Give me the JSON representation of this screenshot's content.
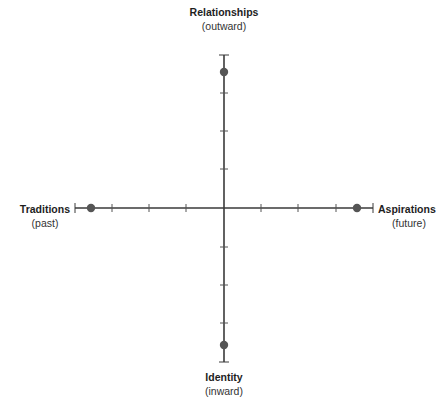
{
  "diagram": {
    "type": "crossed-axes",
    "colors": {
      "axis": "#3a3a3a",
      "tick": "#555555",
      "dot": "#555555",
      "background": "#ffffff"
    },
    "poles": {
      "top": {
        "name": "Relationships",
        "sub": "(outward)"
      },
      "bottom": {
        "name": "Identity",
        "sub": "(inward)"
      },
      "left": {
        "name": "Traditions",
        "sub": "(past)"
      },
      "right": {
        "name": "Aspirations",
        "sub": "(future)"
      }
    },
    "axes": {
      "horizontal": {
        "from": "Traditions",
        "to": "Aspirations",
        "ticks_per_side": 3
      },
      "vertical": {
        "from": "Identity",
        "to": "Relationships",
        "ticks_per_side": 3
      }
    },
    "points": [
      {
        "pole": "top",
        "label": "Relationships"
      },
      {
        "pole": "bottom",
        "label": "Identity"
      },
      {
        "pole": "left",
        "label": "Traditions"
      },
      {
        "pole": "right",
        "label": "Aspirations"
      }
    ]
  }
}
